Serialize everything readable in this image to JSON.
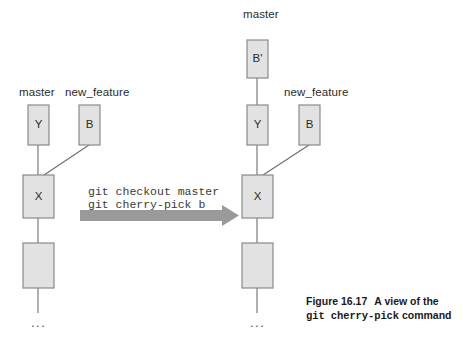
{
  "figure": {
    "caption_label": "Figure 16.17",
    "caption_text_1": "A view of the",
    "caption_mono": "git cherry-pick",
    "caption_text_2": "command"
  },
  "colors": {
    "box_fill": "#e2e2e2",
    "box_stroke": "#8a8a8a",
    "line": "#6e6e6e",
    "arrow": "#9a9a9a",
    "text": "#2b2b2b",
    "background": "#ffffff"
  },
  "transition": {
    "command_line_1": "git checkout master",
    "command_line_2": "git cherry-pick b",
    "arrow_name": "transition-arrow"
  },
  "before": {
    "title": "before-state",
    "branch_labels": [
      {
        "name": "master",
        "text": "master"
      },
      {
        "name": "new_feature",
        "text": "new_feature"
      }
    ],
    "commits": [
      {
        "name": "commit-y",
        "text": "Y"
      },
      {
        "name": "commit-b",
        "text": "B"
      },
      {
        "name": "commit-x",
        "text": "X"
      },
      {
        "name": "commit-blank",
        "text": ""
      }
    ],
    "ellipsis": "..."
  },
  "after": {
    "title": "after-state",
    "branch_labels": [
      {
        "name": "master",
        "text": "master"
      },
      {
        "name": "new_feature",
        "text": "new_feature"
      }
    ],
    "commits": [
      {
        "name": "commit-b-prime",
        "text": "B'"
      },
      {
        "name": "commit-y",
        "text": "Y"
      },
      {
        "name": "commit-b",
        "text": "B"
      },
      {
        "name": "commit-x",
        "text": "X"
      },
      {
        "name": "commit-blank",
        "text": ""
      }
    ],
    "ellipsis": "..."
  }
}
